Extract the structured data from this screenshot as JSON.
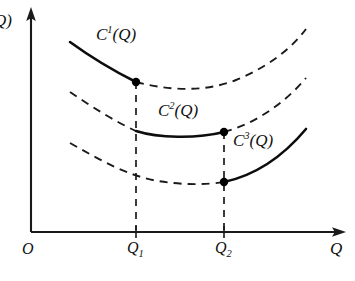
{
  "figure": {
    "kind": "economics-cost-curve-diagram",
    "background_color": "#ffffff",
    "ink_color": "#111111",
    "axes": {
      "y_axis_label": "Q)",
      "y_axis_label_note": "left edge cropped; reads as the tail of C(Q)",
      "x_axis_label": "Q",
      "origin_label": "O",
      "x_axis_y": 232,
      "y_axis_x": 31,
      "x_axis_end": 345,
      "y_axis_top": 9
    },
    "ticks": [
      {
        "label": "Q",
        "sub": "1",
        "x": 136
      },
      {
        "label": "Q",
        "sub": "2",
        "x": 224
      }
    ],
    "curves": [
      {
        "id": "c1",
        "label": "C",
        "superscript": "1",
        "label_tail": "(Q)",
        "solid_range": "left-of-Q1",
        "dashed_range": "right-of-Q1",
        "solid_path": "M 70 42 C 92 58, 116 72, 136 82",
        "dashed_path": "M 136 82 C 170 91, 206 92, 236 80 C 268 67, 292 48, 306 29",
        "dot": {
          "x": 136,
          "y": 82
        }
      },
      {
        "id": "c2",
        "label": "C",
        "superscript": "2",
        "label_tail": "(Q)",
        "solid_range": "Q1-to-Q2",
        "dashed_range": "outside-Q1-Q2",
        "dashed_left_path": "M 70 92 C 92 107, 116 122, 136 131",
        "solid_path": "M 136 131 C 158 138, 196 139, 224 132",
        "dashed_right_path": "M 224 132 C 254 124, 284 104, 306 78",
        "dot": {
          "x": 224,
          "y": 132
        }
      },
      {
        "id": "c3",
        "label": "C",
        "superscript": "3",
        "label_tail": "(Q)",
        "solid_range": "right-of-Q2",
        "dashed_range": "left-of-Q2",
        "dashed_path": "M 70 143 C 100 160, 128 176, 158 181 C 182 185, 206 185, 224 182",
        "solid_path": "M 224 182 C 252 176, 280 160, 306 129",
        "dot": {
          "x": 224,
          "y": 182
        }
      }
    ],
    "drop_lines": [
      {
        "from_x": 136,
        "from_y": 82,
        "to_y": 232
      },
      {
        "from_x": 224,
        "from_y": 132,
        "to_y": 232
      }
    ]
  }
}
